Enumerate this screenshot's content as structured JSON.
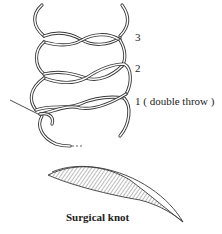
{
  "figure": {
    "caption": "Surgical knot",
    "labels": [
      {
        "id": "throw-3",
        "text": "3"
      },
      {
        "id": "throw-2",
        "text": "2"
      },
      {
        "id": "throw-1",
        "text": "1  ( double throw )"
      }
    ],
    "colors": {
      "line": "#3a3a3a",
      "background": "#ffffff",
      "hatch": "#555555"
    }
  }
}
